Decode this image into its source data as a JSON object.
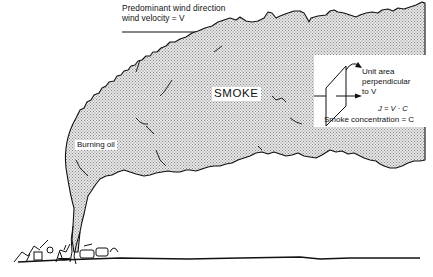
{
  "diagram": {
    "wind": {
      "line1": "Predominant wind direction",
      "line2": "wind velocity = V",
      "arrow": "right-arrow"
    },
    "labels": {
      "smoke": "SMOKE",
      "source": "Burning oil"
    },
    "inset": {
      "line1": "Unit area",
      "line2": "perpendicular",
      "line3": "to V",
      "flux_equation": "J = V · C",
      "concentration": "Smoke concentration = C"
    },
    "colors": {
      "ink": "#111111",
      "smoke_fill": "#d0d0d0",
      "background": "#ffffff"
    }
  }
}
